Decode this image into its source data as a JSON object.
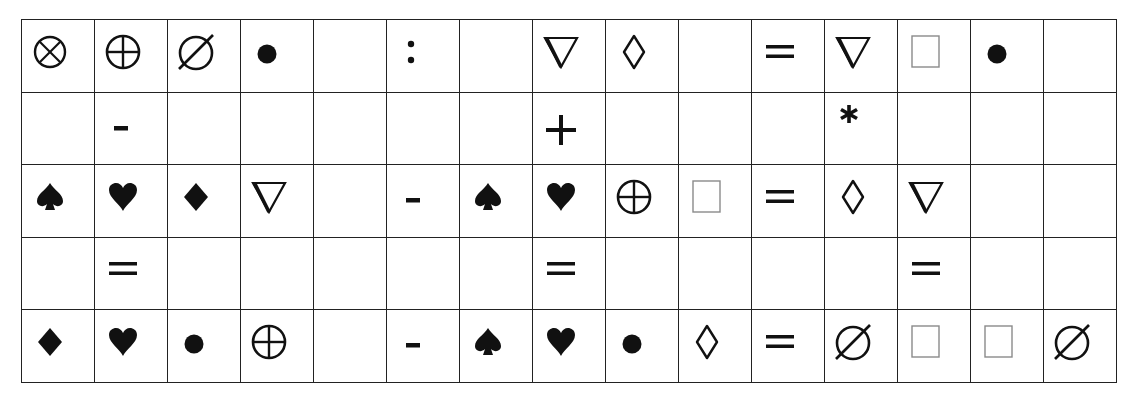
{
  "grid": {
    "rows": 5,
    "cols": 15,
    "cells": [
      [
        "circled-times",
        "circled-plus",
        "empty-set",
        "bullet",
        "",
        "colon",
        "",
        "nabla",
        "lozenge",
        "",
        "equals",
        "nabla",
        "square",
        "bullet",
        ""
      ],
      [
        "",
        "minus",
        "",
        "",
        "",
        "",
        "",
        "plus",
        "",
        "",
        "",
        "asterisk",
        "",
        "",
        ""
      ],
      [
        "spade",
        "heart",
        "diamond",
        "nabla",
        "",
        "minus",
        "spade",
        "heart",
        "circled-plus",
        "square",
        "equals",
        "lozenge",
        "nabla",
        "",
        ""
      ],
      [
        "",
        "equals",
        "",
        "",
        "",
        "",
        "",
        "equals",
        "",
        "",
        "",
        "",
        "equals",
        "",
        ""
      ],
      [
        "diamond",
        "heart",
        "bullet",
        "circled-plus",
        "",
        "minus",
        "spade",
        "heart",
        "bullet",
        "lozenge",
        "equals",
        "empty-set",
        "square",
        "square",
        "empty-set"
      ]
    ]
  },
  "symbols": {
    "circled-times": "⊗",
    "circled-plus": "⊕",
    "empty-set": "∅",
    "bullet": "●",
    "colon": ":",
    "nabla": "∇",
    "lozenge": "◊",
    "equals": "=",
    "square": "□",
    "minus": "-",
    "plus": "+",
    "asterisk": "*",
    "spade": "♠",
    "heart": "♥",
    "diamond": "♦"
  },
  "colors": {
    "line": "#222222",
    "ink": "#111111",
    "square_outline": "#8a8a8a",
    "background": "#ffffff"
  }
}
